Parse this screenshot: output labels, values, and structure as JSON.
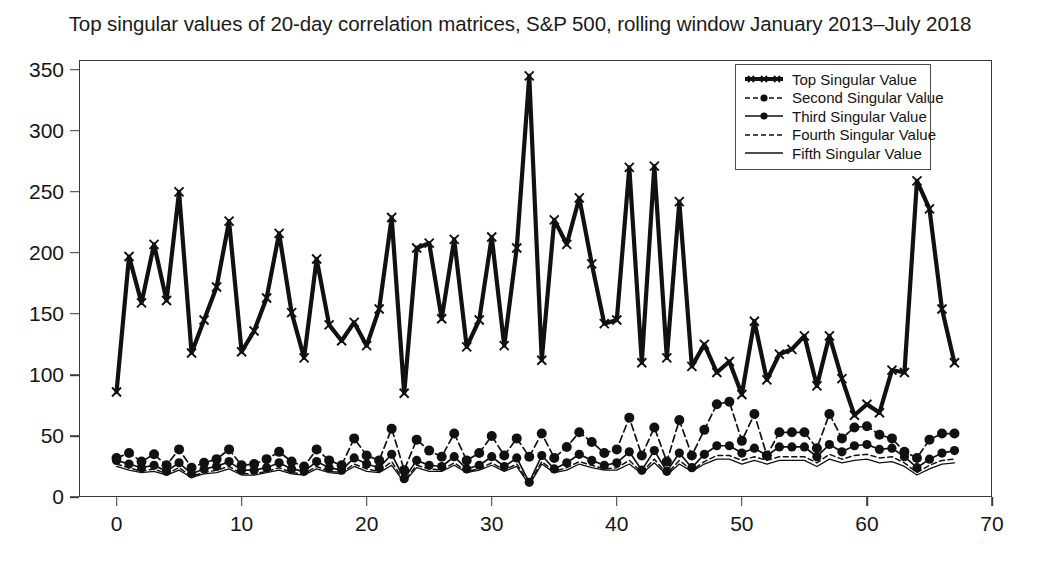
{
  "chart_data": {
    "type": "line",
    "title": "Top singular values of 20-day correlation matrices, S&P 500, rolling window January 2013–July 2018",
    "xlabel": "",
    "ylabel": "",
    "xlim": [
      -3,
      70
    ],
    "ylim": [
      0,
      358
    ],
    "xticks": [
      0,
      10,
      20,
      30,
      40,
      50,
      60,
      70
    ],
    "yticks": [
      0,
      50,
      100,
      150,
      200,
      250,
      300,
      350
    ],
    "grid": false,
    "legend_position": "top-right",
    "x": [
      0,
      1,
      2,
      3,
      4,
      5,
      6,
      7,
      8,
      9,
      10,
      11,
      12,
      13,
      14,
      15,
      16,
      17,
      18,
      19,
      20,
      21,
      22,
      23,
      24,
      25,
      26,
      27,
      28,
      29,
      30,
      31,
      32,
      33,
      34,
      35,
      36,
      37,
      38,
      39,
      40,
      41,
      42,
      43,
      44,
      45,
      46,
      47,
      48,
      49,
      50,
      51,
      52,
      53,
      54,
      55,
      56,
      57,
      58,
      59,
      60,
      61,
      62,
      63,
      64,
      65,
      66,
      67
    ],
    "series": [
      {
        "name": "Top Singular Value",
        "style": "solid-thick-x",
        "values": [
          86,
          197,
          159,
          207,
          161,
          250,
          118,
          145,
          172,
          226,
          119,
          136,
          163,
          216,
          151,
          114,
          195,
          141,
          128,
          143,
          124,
          154,
          229,
          85,
          204,
          208,
          146,
          211,
          123,
          145,
          213,
          124,
          204,
          345,
          112,
          227,
          207,
          245,
          191,
          142,
          145,
          270,
          110,
          271,
          114,
          242,
          107,
          125,
          102,
          111,
          84,
          144,
          96,
          117,
          121,
          132,
          91,
          132,
          97,
          67,
          76,
          69,
          104,
          102,
          259,
          236,
          154,
          110
        ]
      },
      {
        "name": "Second Singular Value",
        "style": "dashed-marker",
        "values": [
          32,
          36,
          29,
          35,
          26,
          39,
          24,
          28,
          31,
          39,
          26,
          27,
          31,
          37,
          29,
          25,
          39,
          30,
          26,
          48,
          34,
          30,
          56,
          22,
          47,
          38,
          33,
          52,
          30,
          36,
          50,
          34,
          48,
          33,
          52,
          32,
          41,
          53,
          45,
          36,
          39,
          65,
          34,
          57,
          29,
          63,
          34,
          55,
          76,
          78,
          46,
          68,
          34,
          53,
          53,
          53,
          40,
          68,
          48,
          57,
          58,
          51,
          48,
          37,
          32,
          47,
          52,
          52
        ]
      },
      {
        "name": "Third Singular Value",
        "style": "solid-marker",
        "values": [
          30,
          27,
          24,
          26,
          21,
          28,
          19,
          23,
          25,
          29,
          22,
          22,
          24,
          28,
          23,
          21,
          29,
          24,
          22,
          32,
          27,
          24,
          35,
          15,
          30,
          26,
          25,
          33,
          23,
          26,
          33,
          25,
          32,
          12,
          34,
          23,
          28,
          35,
          30,
          26,
          28,
          37,
          22,
          38,
          21,
          36,
          24,
          35,
          42,
          42,
          36,
          40,
          34,
          41,
          41,
          41,
          33,
          43,
          37,
          42,
          43,
          39,
          40,
          33,
          24,
          31,
          36,
          38
        ]
      },
      {
        "name": "Fourth Singular Value",
        "style": "dashed-thin",
        "values": [
          27,
          24,
          21,
          23,
          19,
          24,
          17,
          20,
          22,
          25,
          19,
          19,
          21,
          24,
          20,
          19,
          25,
          21,
          20,
          27,
          23,
          21,
          29,
          13,
          26,
          23,
          22,
          28,
          21,
          23,
          28,
          22,
          27,
          11,
          29,
          21,
          24,
          29,
          26,
          23,
          24,
          30,
          20,
          31,
          19,
          30,
          22,
          29,
          34,
          34,
          30,
          33,
          30,
          33,
          33,
          33,
          28,
          35,
          31,
          34,
          35,
          32,
          33,
          28,
          20,
          26,
          30,
          31
        ]
      },
      {
        "name": "Fifth Singular Value",
        "style": "solid-thin",
        "values": [
          25,
          22,
          20,
          21,
          18,
          22,
          16,
          19,
          20,
          23,
          18,
          18,
          20,
          22,
          19,
          18,
          23,
          20,
          19,
          25,
          21,
          20,
          26,
          12,
          24,
          21,
          21,
          26,
          20,
          22,
          26,
          21,
          25,
          10,
          27,
          20,
          22,
          27,
          24,
          22,
          22,
          27,
          19,
          28,
          18,
          27,
          21,
          27,
          31,
          31,
          27,
          30,
          27,
          30,
          30,
          30,
          25,
          31,
          28,
          30,
          31,
          28,
          29,
          25,
          18,
          23,
          27,
          28
        ]
      }
    ]
  },
  "legend": {
    "items": [
      {
        "label": "Top Singular Value"
      },
      {
        "label": "Second Singular Value"
      },
      {
        "label": "Third Singular Value"
      },
      {
        "label": "Fourth Singular Value"
      },
      {
        "label": "Fifth Singular Value"
      }
    ]
  },
  "colors": {
    "ink": "#111111",
    "axis": "#3a3a3a",
    "background": "#ffffff"
  }
}
